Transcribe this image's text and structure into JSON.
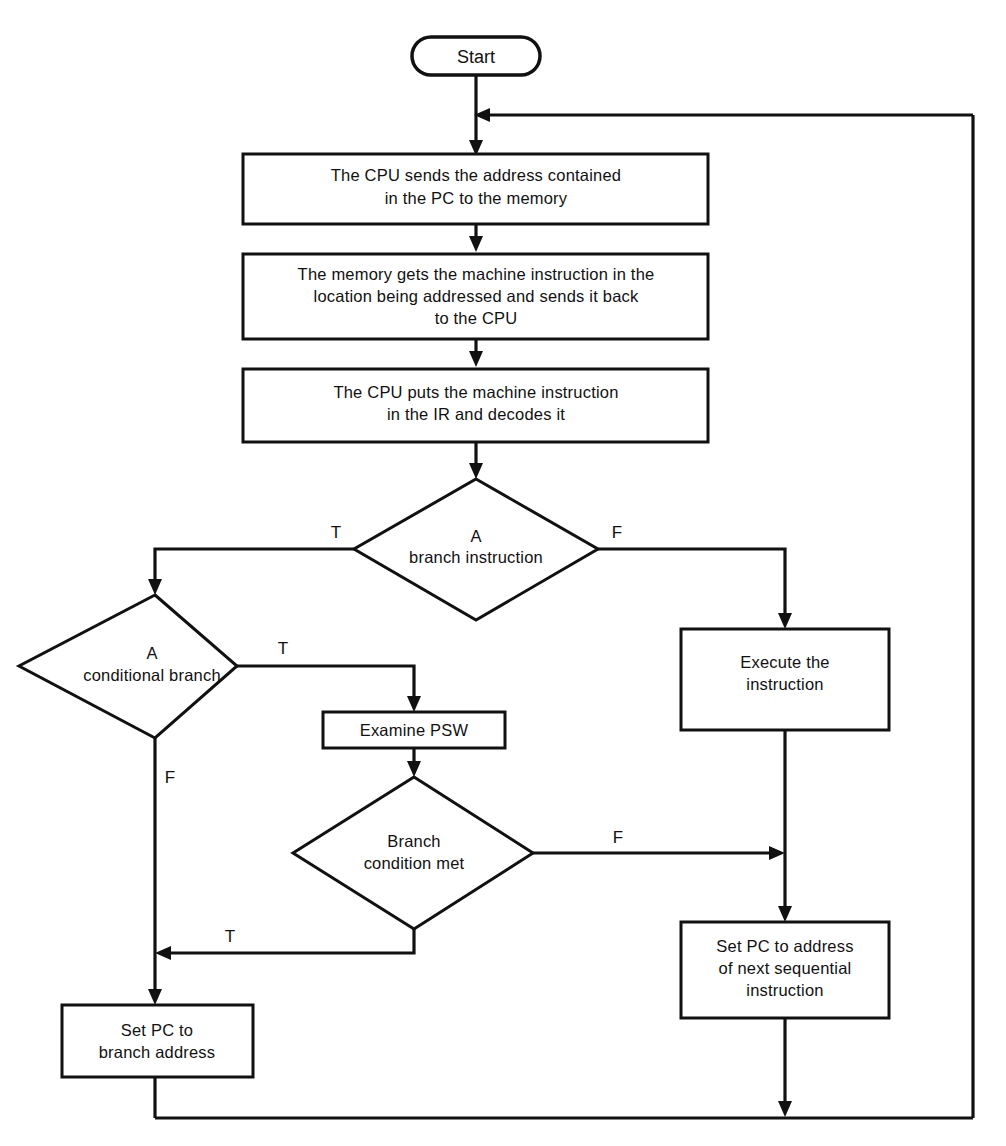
{
  "diagram": {
    "colors": {
      "stroke": "#111111",
      "fill": "#ffffff",
      "background": "#ffffff"
    },
    "nodes": {
      "start": {
        "shape": "terminator",
        "label": "Start"
      },
      "send_address": {
        "shape": "process",
        "line1": "The CPU sends the address contained",
        "line2": "in the PC to the memory"
      },
      "memory_fetch": {
        "shape": "process",
        "line1": "The memory gets the machine instruction in the",
        "line2": "location being addressed and sends it back",
        "line3": "to the CPU"
      },
      "decode": {
        "shape": "process",
        "line1": "The CPU puts the machine instruction",
        "line2": "in the IR and decodes it"
      },
      "branch_instruction": {
        "shape": "decision",
        "line1": "A",
        "line2": "branch instruction"
      },
      "conditional_branch": {
        "shape": "decision",
        "line1": "A",
        "line2": "conditional branch"
      },
      "examine_psw": {
        "shape": "process",
        "line1": "Examine PSW"
      },
      "branch_condition_met": {
        "shape": "decision",
        "line1": "Branch",
        "line2": "condition met"
      },
      "execute": {
        "shape": "process",
        "line1": "Execute the",
        "line2": "instruction"
      },
      "set_pc_sequential": {
        "shape": "process",
        "line1": "Set PC to address",
        "line2": "of next sequential",
        "line3": "instruction"
      },
      "set_pc_branch": {
        "shape": "process",
        "line1": "Set PC to",
        "line2": "branch address"
      }
    },
    "edge_labels": {
      "branch_instruction_true": "T",
      "branch_instruction_false": "F",
      "conditional_branch_true": "T",
      "conditional_branch_false": "F",
      "branch_condition_met_true": "T",
      "branch_condition_met_false": "F"
    }
  }
}
